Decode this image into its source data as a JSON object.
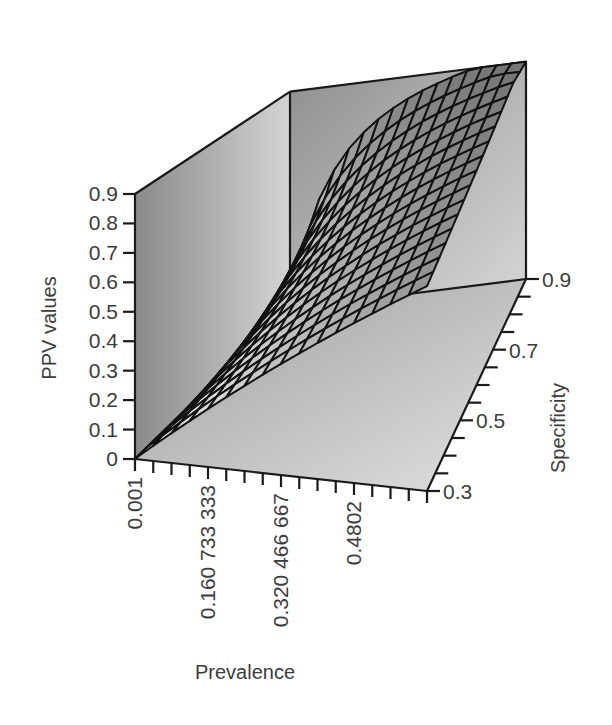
{
  "chart_data": {
    "type": "surface3d",
    "title": "",
    "xlabel": "Prevalence",
    "ylabel": "Specificity",
    "zlabel": "PPV values",
    "x_tick_labels": [
      "0.001",
      "0.160 733 333",
      "0.320 466 667",
      "0.4802"
    ],
    "x_tick_values": [
      0.001,
      0.160733333,
      0.320466667,
      0.4802
    ],
    "x_range": [
      0.001,
      0.64
    ],
    "y_tick_labels": [
      "0.3",
      "0.5",
      "0.7",
      "0.9"
    ],
    "y_tick_values": [
      0.3,
      0.5,
      0.7,
      0.9
    ],
    "y_range": [
      0.3,
      0.9
    ],
    "z_tick_labels": [
      "0",
      "0.1",
      "0.2",
      "0.3",
      "0.4",
      "0.5",
      "0.6",
      "0.7",
      "0.8",
      "0.9"
    ],
    "z_tick_values": [
      0,
      0.1,
      0.2,
      0.3,
      0.4,
      0.5,
      0.6,
      0.7,
      0.8,
      0.9
    ],
    "z_range": [
      0,
      0.9
    ],
    "surface_formula": "PPV = sens*prev / (sens*prev + (1-spec)*(1-prev)), sens fixed",
    "grid_resolution": [
      17,
      17
    ],
    "sample_points": [
      {
        "prevalence": 0.001,
        "specificity": 0.3,
        "ppv": 0.0
      },
      {
        "prevalence": 0.001,
        "specificity": 0.9,
        "ppv": 0.0
      },
      {
        "prevalence": 0.64,
        "specificity": 0.3,
        "ppv": 0.33
      },
      {
        "prevalence": 0.64,
        "specificity": 0.9,
        "ppv": 0.9
      },
      {
        "prevalence": 0.32,
        "specificity": 0.9,
        "ppv": 0.78
      }
    ],
    "grid": false,
    "legend": null,
    "colors": {
      "wall": "#9a9a9a",
      "floor": "#c8c8c8",
      "mesh_line": "#111111",
      "mesh_fill_light": "#f4f4f4",
      "mesh_fill_dark": "#8c8c8c"
    }
  }
}
